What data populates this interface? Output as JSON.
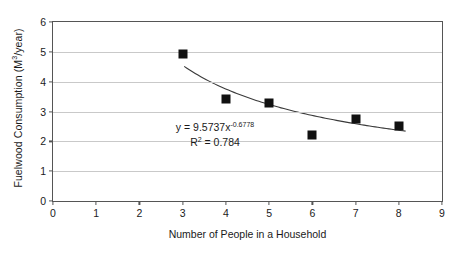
{
  "chart_data": {
    "type": "scatter",
    "title": "",
    "xlabel": "Number of People in a Household",
    "ylabel": "Fuelwood Consumption (M3/year)",
    "ylabel_prefix": "Fuelwood Consumption (M",
    "ylabel_sup": "3",
    "ylabel_suffix": "/year)",
    "x": [
      3,
      4,
      5,
      6,
      7,
      8
    ],
    "values": [
      4.93,
      3.43,
      3.27,
      2.2,
      2.75,
      2.52
    ],
    "series": [
      {
        "name": "Fuelwood consumption",
        "x": [
          3,
          4,
          5,
          6,
          7,
          8
        ],
        "values": [
          4.93,
          3.43,
          3.27,
          2.2,
          2.75,
          2.52
        ]
      }
    ],
    "xlim": [
      0,
      9
    ],
    "ylim": [
      0,
      6
    ],
    "xticks": [
      0,
      1,
      2,
      3,
      4,
      5,
      6,
      7,
      8,
      9
    ],
    "yticks": [
      0,
      1,
      2,
      3,
      4,
      5,
      6
    ],
    "grid": "horizontal",
    "legend": "none",
    "trendline": {
      "type": "power",
      "coefficient": 9.5737,
      "exponent": -0.6778,
      "r_squared": 0.784,
      "x_start": 3.05,
      "x_end": 8.2
    },
    "annotations": {
      "equation_prefix": "y = 9.5737x",
      "equation_exponent": "-0.6778",
      "r_squared_prefix": "R",
      "r_squared_sup": "2",
      "r_squared_value": " = 0.784"
    },
    "colors": {
      "marker": "#111111",
      "trendline": "#3a3a3a",
      "gridline": "#c9c9c9",
      "axis": "#555555",
      "background": "#ffffff",
      "text": "#1a1a1a"
    }
  }
}
